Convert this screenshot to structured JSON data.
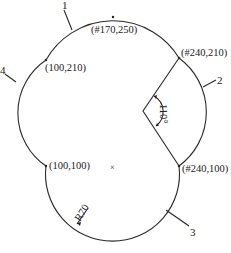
{
  "diagram": {
    "type": "cam profile / arc construction drawing",
    "stroke_color": "#2a2a2a",
    "points": [
      {
        "id": "top",
        "label": "(#170,250)"
      },
      {
        "id": "upper-right",
        "label": "(#240,210)"
      },
      {
        "id": "lower-right",
        "label": "(#240,100)"
      },
      {
        "id": "lower-left",
        "label": "(100,100)"
      },
      {
        "id": "upper-left",
        "label": "(100,210)"
      }
    ],
    "arc_numbers": [
      "1",
      "2",
      "3",
      "4"
    ],
    "angle_label": "110°",
    "radius_label": "R70",
    "center_marker": "×"
  }
}
